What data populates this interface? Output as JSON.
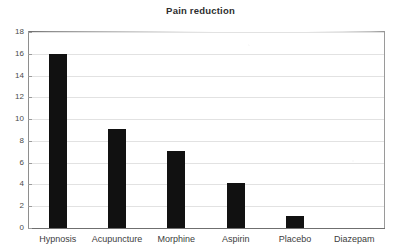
{
  "chart_data": {
    "type": "bar",
    "title": "Pain reduction",
    "xlabel": "",
    "ylabel": "",
    "categories": [
      "Hypnosis",
      "Acupuncture",
      "Morphine",
      "Aspirin",
      "Placebo",
      "Diazepam"
    ],
    "values": [
      16.0,
      9.1,
      7.1,
      4.1,
      1.1,
      0
    ],
    "ylim": [
      0,
      18
    ],
    "ytick_labels": [
      "0",
      "2",
      "4",
      "6",
      "8",
      "10",
      "12",
      "14",
      "16",
      "18"
    ],
    "ytick_values": [
      0,
      2,
      4,
      6,
      8,
      10,
      12,
      14,
      16,
      18
    ],
    "grid": true,
    "legend": "none",
    "bar_color": "#111111",
    "grid_color": "#e2e2e2",
    "axis_color": "#6f6f6f",
    "text_color": "#3d3d3d",
    "background": "#ffffff"
  }
}
